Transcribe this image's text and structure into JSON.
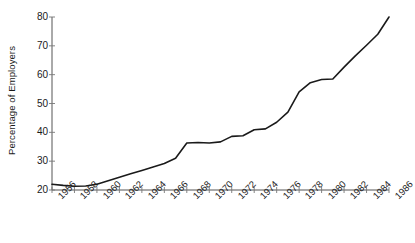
{
  "chart_data": {
    "type": "line",
    "title": "",
    "xlabel": "",
    "ylabel": "Percentage of Employers",
    "xlim": [
      1956,
      1986
    ],
    "ylim": [
      20,
      80
    ],
    "grid": false,
    "legend": null,
    "x_tick_labels": [
      "1956",
      "1958",
      "1960",
      "1962",
      "1964",
      "1966",
      "1968",
      "1970",
      "1972",
      "1974",
      "1976",
      "1978",
      "1980",
      "1982",
      "1984",
      "1986"
    ],
    "x_ticks": [
      1956,
      1958,
      1960,
      1962,
      1964,
      1966,
      1968,
      1970,
      1972,
      1974,
      1976,
      1978,
      1980,
      1982,
      1984,
      1986
    ],
    "y_tick_labels": [
      "20",
      "30",
      "40",
      "50",
      "60",
      "70",
      "80"
    ],
    "y_ticks": [
      20,
      30,
      40,
      50,
      60,
      70,
      80
    ],
    "line_color": "#1a1a1a",
    "line_width": 1.6,
    "series": [
      {
        "name": "Percentage of Employers",
        "x": [
          1956,
          1957,
          1958,
          1959,
          1960,
          1961,
          1962,
          1963,
          1964,
          1965,
          1966,
          1967,
          1968,
          1969,
          1970,
          1971,
          1972,
          1973,
          1974,
          1975,
          1976,
          1977,
          1978,
          1979,
          1980,
          1981,
          1982,
          1983,
          1984,
          1985,
          1986
        ],
        "values": [
          22.0,
          21.6,
          21.3,
          21.4,
          22.0,
          23.2,
          24.4,
          25.6,
          26.8,
          28.0,
          29.2,
          31.0,
          36.3,
          36.5,
          36.3,
          36.7,
          38.6,
          38.8,
          40.9,
          41.2,
          43.5,
          47.0,
          54.0,
          57.2,
          58.3,
          58.5,
          62.6,
          66.5,
          70.2,
          74.0,
          80.0
        ]
      }
    ]
  },
  "axis_geometry": {
    "plot_left": 52,
    "plot_right": 389,
    "plot_top": 17,
    "plot_bottom": 190
  }
}
